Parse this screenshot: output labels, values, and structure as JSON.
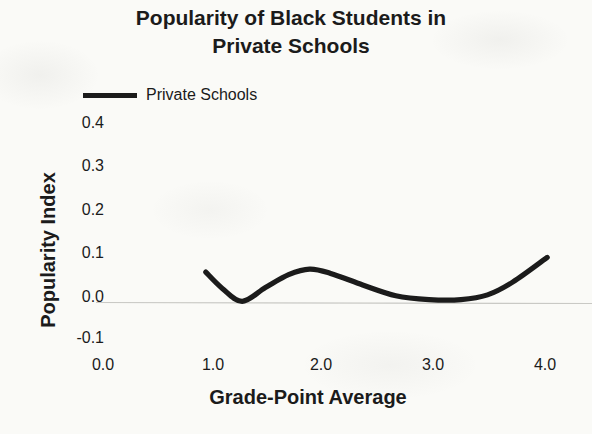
{
  "title": {
    "line1": "Popularity of Black Students in",
    "line2": "Private Schools"
  },
  "legend": {
    "label": "Private Schools"
  },
  "y_axis": {
    "title": "Popularity Index",
    "ticks": [
      "0.4",
      "0.3",
      "0.2",
      "0.1",
      "0.0",
      "-0.1"
    ]
  },
  "x_axis": {
    "title": "Grade-Point Average",
    "ticks": [
      "0.0",
      "1.0",
      "2.0",
      "3.0",
      "4.0"
    ]
  },
  "colors": {
    "line": "#1b1b1b",
    "text": "#1b1b1b",
    "zero_line": "#c9c9c5",
    "background": "#fafaf7"
  },
  "chart_data": {
    "type": "line",
    "title": "Popularity of Black Students in Private Schools",
    "xlabel": "Grade-Point Average",
    "ylabel": "Popularity Index",
    "xlim": [
      0.0,
      4.0
    ],
    "ylim": [
      -0.1,
      0.4
    ],
    "x_ticks": [
      0.0,
      1.0,
      2.0,
      3.0,
      4.0
    ],
    "y_ticks": [
      -0.1,
      0.0,
      0.1,
      0.2,
      0.3,
      0.4
    ],
    "grid": false,
    "legend_position": "top-left",
    "series": [
      {
        "name": "Private Schools",
        "points": [
          [
            0.93,
            0.058
          ],
          [
            1.08,
            0.02
          ],
          [
            1.26,
            -0.01
          ],
          [
            1.47,
            0.022
          ],
          [
            1.68,
            0.052
          ],
          [
            1.87,
            0.065
          ],
          [
            2.06,
            0.055
          ],
          [
            2.35,
            0.028
          ],
          [
            2.65,
            0.003
          ],
          [
            2.95,
            -0.006
          ],
          [
            3.24,
            -0.006
          ],
          [
            3.48,
            0.005
          ],
          [
            3.71,
            0.035
          ],
          [
            4.02,
            0.092
          ]
        ]
      }
    ]
  }
}
